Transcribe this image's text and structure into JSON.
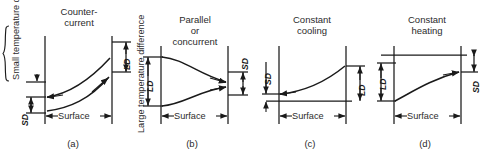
{
  "figure": {
    "background_color": "#ffffff",
    "line_color": "#1a1a1a",
    "text_color": "#2b2b2b",
    "axis_label": "Surface",
    "small_diff_label": "Small temperature difference",
    "large_diff_label": "Large temperature difference",
    "dim_small": "SD",
    "dim_large": "LD"
  },
  "panels": [
    {
      "id": "a",
      "caption": "(a)",
      "title_line1": "Counter-",
      "title_line2": "current",
      "x_axis_label": "Surface",
      "left_dim": "SD",
      "right_dim": "LD",
      "flow": "countercurrent",
      "curve_top_desc": "upper curve rising left-to-right with arrow pointing left",
      "curve_bottom_desc": "lower curve rising left-to-right with arrow pointing right"
    },
    {
      "id": "b",
      "caption": "(b)",
      "title_line1": "Parallel",
      "title_line2": "or",
      "title_line3": "concurrent",
      "x_axis_label": "Surface",
      "left_dim": "LD",
      "right_dim": "SD",
      "flow": "parallel",
      "curve_top_desc": "upper curve falling left-to-right with arrow pointing right",
      "curve_bottom_desc": "lower curve rising left-to-right with arrow pointing right"
    },
    {
      "id": "c",
      "caption": "(c)",
      "title_line1": "Constant",
      "title_line2": "cooling",
      "x_axis_label": "Surface",
      "left_dim": "SD",
      "right_dim": "LD",
      "flow": "constant-cooling",
      "curve_desc": "convex curve rising left-to-right, arrow pointing left, horizontal baseline below"
    },
    {
      "id": "d",
      "caption": "(d)",
      "title_line1": "Constant",
      "title_line2": "heating",
      "x_axis_label": "Surface",
      "left_dim": "LD",
      "right_dim": "SD",
      "flow": "constant-heating",
      "curve_desc": "concave curve rising left-to-right, arrow pointing right, horizontal top line above"
    }
  ]
}
